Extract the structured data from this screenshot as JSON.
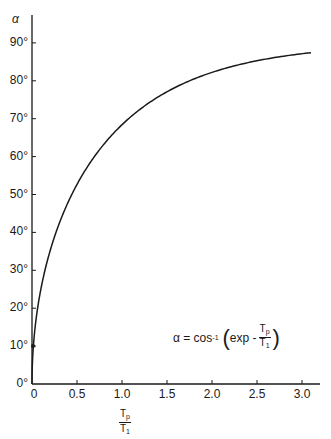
{
  "chart_data": {
    "type": "line",
    "title": "",
    "xlabel": "Tp / T1",
    "ylabel": "α",
    "xlim": [
      0,
      3.1
    ],
    "ylim": [
      0,
      90
    ],
    "grid": false,
    "legend": null,
    "x_ticks": [
      "0",
      "0.5",
      "1.0",
      "1.5",
      "2.0",
      "2.5",
      "3.0"
    ],
    "y_ticks": [
      "0°",
      "10°",
      "20°",
      "30°",
      "40°",
      "50°",
      "60°",
      "70°",
      "80°",
      "90°"
    ],
    "annotation": "α = cos⁻¹ (exp − Tp/T1)",
    "series": [
      {
        "name": "α = cos⁻¹(exp(−Tp/T1))",
        "x": [
          0,
          0.02,
          0.05,
          0.1,
          0.2,
          0.3,
          0.4,
          0.5,
          0.6,
          0.7,
          0.8,
          0.9,
          1.0,
          1.2,
          1.4,
          1.5,
          1.6,
          1.8,
          2.0,
          2.2,
          2.5,
          2.8,
          3.0,
          3.1
        ],
        "values": [
          0,
          11.4,
          18.0,
          25.2,
          35.1,
          42.2,
          47.8,
          52.7,
          56.7,
          60.3,
          63.3,
          66.0,
          68.4,
          72.4,
          75.7,
          77.1,
          78.4,
          80.5,
          82.2,
          83.7,
          85.3,
          86.5,
          87.1,
          87.4
        ]
      }
    ]
  },
  "axes": {
    "y_title": "α",
    "y_labels": [
      "0°",
      "10°",
      "20°",
      "30°",
      "40°",
      "50°",
      "60°",
      "70°",
      "80°",
      "90°"
    ],
    "x_labels": [
      "0",
      "0.5",
      "1.0",
      "1.5",
      "2.0",
      "2.5",
      "3.0"
    ],
    "x_title_num": "T",
    "x_title_num_sub": "p",
    "x_title_den": "T",
    "x_title_den_sub": "1"
  },
  "formula": {
    "lhs": "α = cos",
    "sup": "-1",
    "open": "(",
    "exp": "exp -",
    "num": "T",
    "num_sub": "p",
    "den": "T",
    "den_sub": "1",
    "close": ")"
  }
}
